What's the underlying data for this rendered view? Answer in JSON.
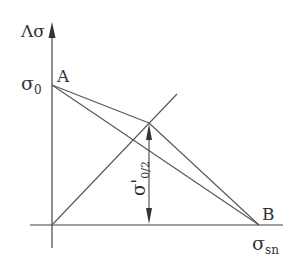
{
  "diagram": {
    "type": "stress-diagram",
    "colors": {
      "axis": "#444444",
      "line": "#555555",
      "text": "#333333",
      "background": "#ffffff"
    },
    "axes": {
      "y_label": "Λσ",
      "x_label_main": "σ",
      "x_label_sub": "sn",
      "origin": [
        52,
        225
      ]
    },
    "points": {
      "A": {
        "label": "A",
        "x": 52,
        "y": 85,
        "value_label_main": "σ",
        "value_label_sub": "0"
      },
      "B": {
        "label": "B",
        "x": 259,
        "y": 225
      },
      "P": {
        "x": 149,
        "y": 123
      }
    },
    "dimension": {
      "label_main": "σ'",
      "label_sub": "0/2"
    }
  }
}
